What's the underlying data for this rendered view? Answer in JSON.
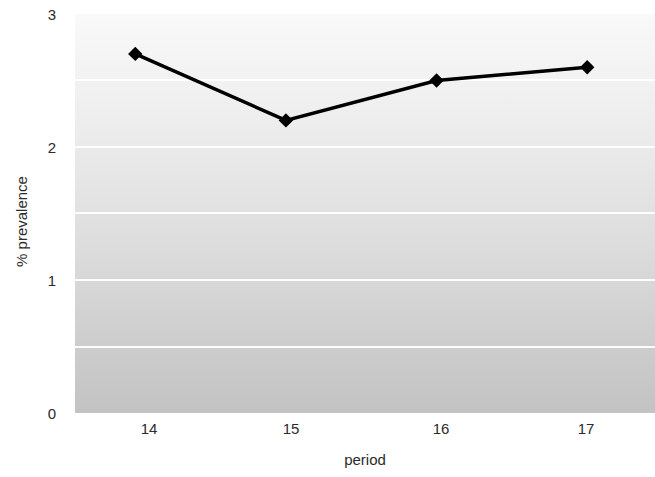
{
  "chart_data": {
    "type": "line",
    "title": "",
    "subtitle": "",
    "xlabel": "period",
    "ylabel": "% prevalence",
    "categories": [
      "14",
      "15",
      "16",
      "17"
    ],
    "x": [
      14,
      15,
      16,
      17
    ],
    "values": [
      2.7,
      2.2,
      2.5,
      2.6
    ],
    "series": [
      {
        "name": "% prevalence",
        "values": [
          2.7,
          2.2,
          2.5,
          2.6
        ],
        "line_color": "#000000",
        "marker": "diamond",
        "marker_color": "#000000"
      }
    ],
    "ylim": [
      0,
      3
    ],
    "xlim": [
      13.6,
      17.45
    ],
    "y_ticks": [
      0,
      1,
      2,
      3
    ],
    "y_ticklabels": [
      "0",
      "1",
      "2",
      "3"
    ],
    "x_ticks": [
      14,
      15,
      16,
      17
    ],
    "x_ticklabels": [
      "14",
      "15",
      "16",
      "17"
    ],
    "gridlines": {
      "horizontal": true,
      "vertical": false,
      "interval": 0.5,
      "values": [
        0.5,
        1.0,
        1.5,
        2.0,
        2.5
      ],
      "color": "#ffffff"
    },
    "legend": {
      "visible": false,
      "position": "none",
      "entries": []
    },
    "plot_background": {
      "type": "vertical-gradient",
      "top_color": "#f9f9f9",
      "bottom_color": "#c3c3c3"
    },
    "figure_background": "#ffffff",
    "annotations": []
  }
}
